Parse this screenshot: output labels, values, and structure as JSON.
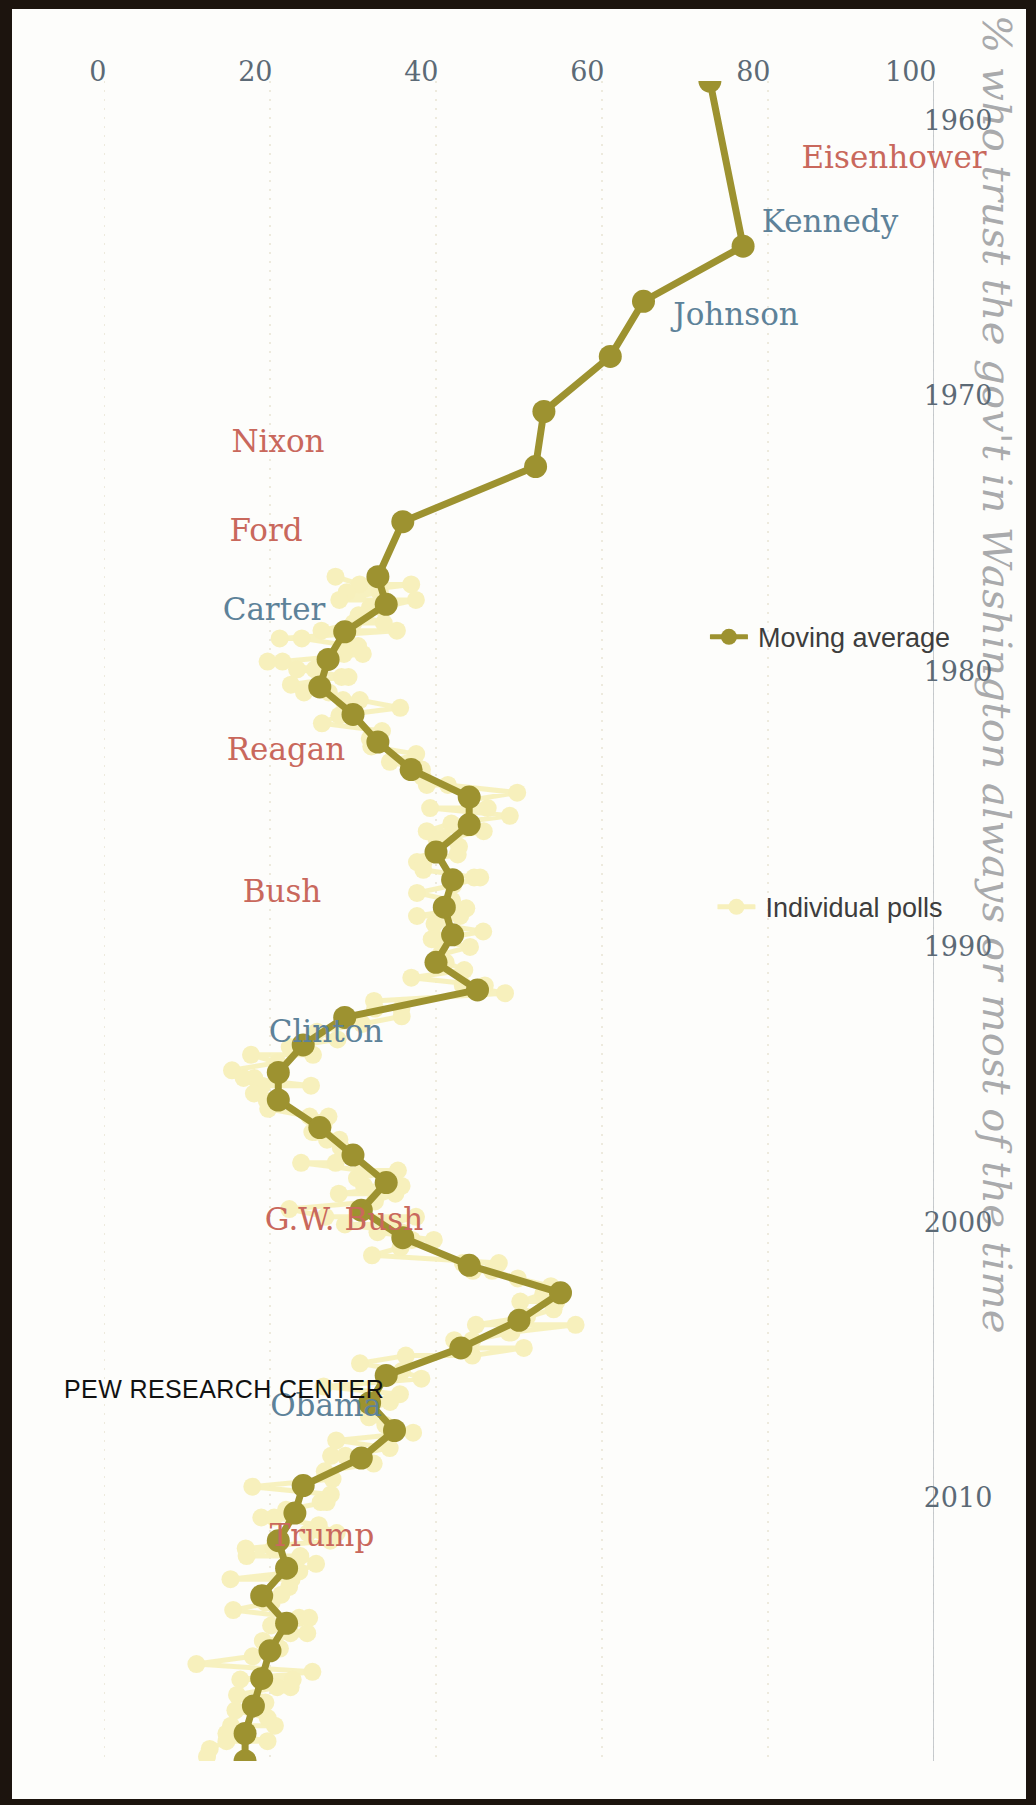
{
  "figure": {
    "title": "% who trust the gov't in Washington always or most of the time",
    "brand": "PEW RESEARCH CENTER"
  },
  "legend": {
    "items": [
      {
        "label": "Moving average",
        "color": "#9d9230",
        "marker": "line-with-dot"
      },
      {
        "label": "Individual polls",
        "color": "#f7f0bc",
        "marker": "dot"
      }
    ]
  },
  "presidents": [
    {
      "name": "Eisenhower",
      "party": "rep",
      "color": "#c9685c"
    },
    {
      "name": "Kennedy",
      "party": "dem",
      "color": "#5d8299"
    },
    {
      "name": "Johnson",
      "party": "dem",
      "color": "#5d8299"
    },
    {
      "name": "Nixon",
      "party": "rep",
      "color": "#c9685c"
    },
    {
      "name": "Ford",
      "party": "rep",
      "color": "#c9685c"
    },
    {
      "name": "Carter",
      "party": "dem",
      "color": "#5d8299"
    },
    {
      "name": "Reagan",
      "party": "rep",
      "color": "#c9685c"
    },
    {
      "name": "Bush",
      "party": "rep",
      "color": "#c9685c"
    },
    {
      "name": "Clinton",
      "party": "dem",
      "color": "#5d8299"
    },
    {
      "name": "G.W. Bush",
      "party": "rep",
      "color": "#c9685c"
    },
    {
      "name": "Obama",
      "party": "dem",
      "color": "#5d8299"
    },
    {
      "name": "Trump",
      "party": "rep",
      "color": "#c9685c"
    }
  ],
  "chart_data": {
    "type": "line",
    "title": "% who trust the gov't in Washington always or most of the time",
    "xlabel": "",
    "ylabel": "",
    "xlim": [
      1958,
      2019
    ],
    "ylim": [
      0,
      100
    ],
    "xticks": [
      1960,
      1970,
      1980,
      1990,
      2000,
      2010
    ],
    "yticks": [
      0,
      20,
      40,
      60,
      80,
      100
    ],
    "grid": "faint vertical gridlines at y=0,20,40,60,80,100",
    "legend_position": "left-inside",
    "orientation": "rotated 90 degrees clockwise; time axis runs top-to-bottom, percent axis runs right-to-left",
    "series": [
      {
        "name": "Moving average",
        "color": "#9d9230",
        "x": [
          1958,
          1964,
          1966,
          1968,
          1970,
          1972,
          1974,
          1976,
          1977,
          1978,
          1979,
          1980,
          1981,
          1982,
          1983,
          1984,
          1985,
          1986,
          1987,
          1988,
          1989,
          1990,
          1991,
          1992,
          1993,
          1994,
          1995,
          1996,
          1997,
          1998,
          1999,
          2000,
          2001,
          2002,
          2003,
          2004,
          2005,
          2006,
          2007,
          2008,
          2009,
          2010,
          2011,
          2012,
          2013,
          2014,
          2015,
          2016,
          2017,
          2018,
          2019
        ],
        "y": [
          73,
          77,
          65,
          61,
          53,
          52,
          36,
          33,
          34,
          29,
          27,
          26,
          30,
          33,
          37,
          44,
          44,
          40,
          42,
          41,
          42,
          40,
          45,
          29,
          24,
          21,
          21,
          26,
          30,
          34,
          31,
          36,
          44,
          55,
          50,
          43,
          34,
          32,
          35,
          31,
          24,
          23,
          21,
          22,
          19,
          22,
          20,
          19,
          18,
          17,
          17
        ]
      },
      {
        "name": "Individual polls",
        "color": "#f7f0bc",
        "note": "scatter of individual survey readings around the moving average, roughly 1976-2019, ranging about 10% to 60%"
      }
    ],
    "annotations": [
      "Peak trust ~77% in 1964 (Johnson)",
      "Post-9/11 spike to ~55% in 2002 (G.W. Bush)",
      "Record lows near 17% in 2019 (Trump)"
    ]
  },
  "axes": {
    "y_tick_labels": [
      "0",
      "20",
      "40",
      "60",
      "80",
      "100"
    ],
    "x_tick_labels": [
      "1960",
      "1970",
      "1980",
      "1990",
      "2000",
      "2010"
    ]
  }
}
